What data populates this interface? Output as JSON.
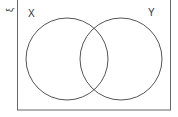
{
  "diagram": {
    "type": "venn",
    "universal_symbol": "ξ",
    "sets": [
      {
        "label": "X"
      },
      {
        "label": "Y"
      }
    ],
    "colors": {
      "stroke": "#555555",
      "background": "#ffffff"
    }
  }
}
